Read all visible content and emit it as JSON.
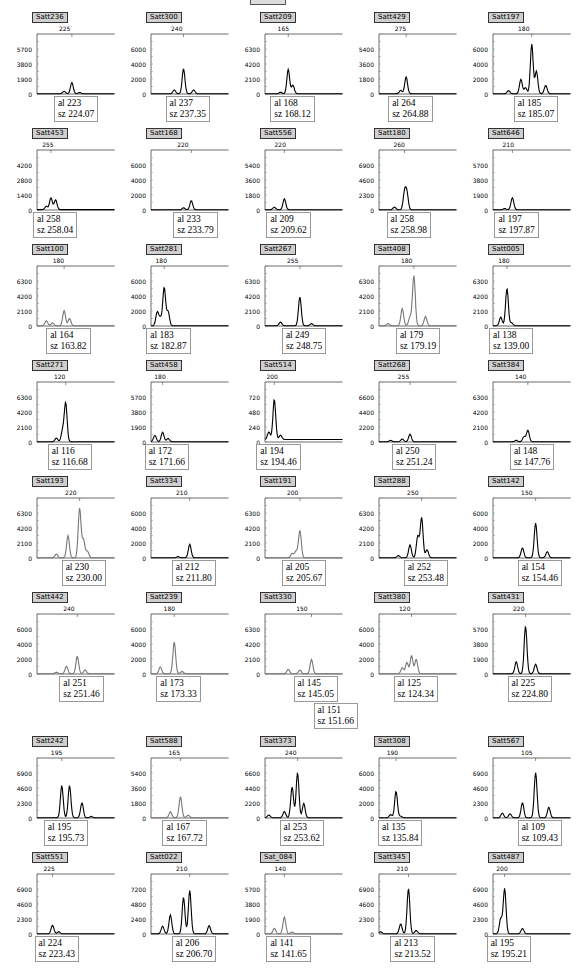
{
  "figure": {
    "top_marker": ""
  },
  "chart_data": [
    {
      "type": "line",
      "marker": "Satt236",
      "peak_label": "225",
      "yticks": [
        "5700",
        "3800",
        "1900",
        "0"
      ],
      "ymax": 7600,
      "trace_color": "#000",
      "peaks": [
        [
          0.45,
          1400
        ],
        [
          0.35,
          300
        ],
        [
          0.55,
          150
        ]
      ],
      "al": "al 223",
      "sz": "sz 224.07"
    },
    {
      "type": "line",
      "marker": "Satt300",
      "peak_label": "240",
      "yticks": [
        "6000",
        "4000",
        "2000",
        "0"
      ],
      "ymax": 8000,
      "trace_color": "#000",
      "peaks": [
        [
          0.42,
          3300
        ],
        [
          0.3,
          500
        ],
        [
          0.55,
          500
        ]
      ],
      "al": "al 237",
      "sz": "sz 237.35"
    },
    {
      "type": "line",
      "marker": "Satt209",
      "peak_label": "165",
      "yticks": [
        "6300",
        "4200",
        "2100",
        "0"
      ],
      "ymax": 8400,
      "trace_color": "#000",
      "peaks": [
        [
          0.3,
          3400
        ],
        [
          0.36,
          1200
        ],
        [
          0.2,
          200
        ]
      ],
      "al": "al 168",
      "sz": "sz 168.12"
    },
    {
      "type": "line",
      "marker": "Satt429",
      "peak_label": "275",
      "yticks": [
        "5400",
        "3600",
        "1800",
        "0"
      ],
      "ymax": 7200,
      "trace_color": "#000",
      "peaks": [
        [
          0.35,
          2000
        ],
        [
          0.28,
          400
        ]
      ],
      "al": "al 264",
      "sz": "sz 264.88"
    },
    {
      "type": "line",
      "marker": "Satt197",
      "peak_label": "180",
      "yticks": [
        "6000",
        "4000",
        "2000",
        "0"
      ],
      "ymax": 8000,
      "trace_color": "#000",
      "peaks": [
        [
          0.5,
          6600
        ],
        [
          0.56,
          3000
        ],
        [
          0.36,
          1900
        ],
        [
          0.68,
          1100
        ],
        [
          0.2,
          400
        ],
        [
          0.42,
          800
        ]
      ],
      "al": "al 185",
      "sz": "sz 185.07"
    },
    {
      "type": "line",
      "marker": "Satt453",
      "peak_label": "255",
      "yticks": [
        "4200",
        "2800",
        "1400",
        "0"
      ],
      "ymax": 5600,
      "trace_color": "#000",
      "peaks": [
        [
          0.18,
          1100
        ],
        [
          0.24,
          900
        ],
        [
          0.12,
          300
        ]
      ],
      "al": "al 258",
      "sz": "sz 258.04"
    },
    {
      "type": "line",
      "marker": "Satt168",
      "peak_label": "220",
      "yticks": [
        "6000",
        "4000",
        "2000",
        "0"
      ],
      "ymax": 8000,
      "trace_color": "#000",
      "peaks": [
        [
          0.52,
          1200
        ],
        [
          0.42,
          250
        ]
      ],
      "al": "al 233",
      "sz": "sz 233.79"
    },
    {
      "type": "line",
      "marker": "Satt556",
      "peak_label": "220",
      "yticks": [
        "5400",
        "3600",
        "1800",
        "0"
      ],
      "ymax": 7200,
      "trace_color": "#000",
      "peaks": [
        [
          0.25,
          1300
        ],
        [
          0.12,
          300
        ]
      ],
      "al": "al 209",
      "sz": "sz 209.62"
    },
    {
      "type": "line",
      "marker": "Satt180",
      "peak_label": "260",
      "yticks": [
        "6900",
        "4600",
        "2300",
        "0"
      ],
      "ymax": 9200,
      "trace_color": "#000",
      "peaks": [
        [
          0.33,
          2600
        ],
        [
          0.2,
          400
        ],
        [
          0.36,
          2400
        ]
      ],
      "al": "al 258",
      "sz": "sz 258.98"
    },
    {
      "type": "line",
      "marker": "Satt646",
      "peak_label": "210",
      "yticks": [
        "5700",
        "3800",
        "1900",
        "0"
      ],
      "ymax": 7600,
      "trace_color": "#000",
      "peaks": [
        [
          0.25,
          1500
        ],
        [
          0.15,
          150
        ]
      ],
      "al": "al 197",
      "sz": "sz 197.87"
    },
    {
      "type": "line",
      "marker": "Satt100",
      "peak_label": "180",
      "yticks": [
        "6300",
        "4200",
        "2100",
        "0"
      ],
      "ymax": 8400,
      "trace_color": "#777",
      "peaks": [
        [
          0.35,
          2100
        ],
        [
          0.42,
          1000
        ],
        [
          0.12,
          700
        ],
        [
          0.2,
          400
        ]
      ],
      "al": "al 164",
      "sz": "sz 163.82"
    },
    {
      "type": "line",
      "marker": "Satt281",
      "peak_label": "180",
      "yticks": [
        "6000",
        "4000",
        "2000",
        "0"
      ],
      "ymax": 8000,
      "trace_color": "#000",
      "peaks": [
        [
          0.17,
          5100
        ],
        [
          0.08,
          1800
        ],
        [
          0.22,
          1900
        ],
        [
          0.12,
          1000
        ]
      ],
      "al": "al 183",
      "sz": "sz 182.87"
    },
    {
      "type": "line",
      "marker": "Satt267",
      "peak_label": "255",
      "yticks": [
        "6300",
        "4200",
        "2100",
        "0"
      ],
      "ymax": 8400,
      "trace_color": "#000",
      "peaks": [
        [
          0.45,
          4000
        ],
        [
          0.2,
          500
        ],
        [
          0.6,
          300
        ]
      ],
      "al": "al 249",
      "sz": "sz 248.75"
    },
    {
      "type": "line",
      "marker": "Satt408",
      "peak_label": "180",
      "yticks": [
        "6300",
        "4200",
        "2100",
        "0"
      ],
      "ymax": 8400,
      "trace_color": "#777",
      "peaks": [
        [
          0.45,
          7000
        ],
        [
          0.3,
          2400
        ],
        [
          0.6,
          1300
        ],
        [
          0.12,
          300
        ],
        [
          0.4,
          1200
        ]
      ],
      "al": "al 179",
      "sz": "sz 179.19"
    },
    {
      "type": "line",
      "marker": "Satt005",
      "peak_label": "180",
      "yticks": [
        "6300",
        "4200",
        "2100",
        "0"
      ],
      "ymax": 8400,
      "trace_color": "#000",
      "peaks": [
        [
          0.18,
          5200
        ],
        [
          0.1,
          1200
        ],
        [
          0.24,
          400
        ]
      ],
      "al": "al 138",
      "sz": "sz 139.00"
    },
    {
      "type": "line",
      "marker": "Satt271",
      "peak_label": "120",
      "yticks": [
        "6300",
        "4200",
        "2100",
        "0"
      ],
      "ymax": 8400,
      "trace_color": "#000",
      "peaks": [
        [
          0.37,
          5400
        ],
        [
          0.33,
          1500
        ],
        [
          0.25,
          500
        ]
      ],
      "al": "al 116",
      "sz": "sz 116.68"
    },
    {
      "type": "line",
      "marker": "Satt458",
      "peak_label": "180",
      "yticks": [
        "5700",
        "3800",
        "1900",
        "0"
      ],
      "ymax": 7600,
      "trace_color": "#000",
      "peaks": [
        [
          0.15,
          1200
        ],
        [
          0.05,
          800
        ],
        [
          0.22,
          400
        ]
      ],
      "al": "al 172",
      "sz": "sz 171.66"
    },
    {
      "type": "line",
      "marker": "Satt514",
      "peak_label": "200",
      "yticks": [
        "720",
        "480",
        "240",
        "0"
      ],
      "ymax": 960,
      "trace_color": "#000",
      "peaks": [
        [
          0.12,
          640
        ],
        [
          0.05,
          120
        ],
        [
          0.2,
          70
        ]
      ],
      "al": "al 194",
      "sz": "sz 194.46"
    },
    {
      "type": "line",
      "marker": "Satt268",
      "peak_label": "255",
      "yticks": [
        "6600",
        "4400",
        "2200",
        "0"
      ],
      "ymax": 8800,
      "trace_color": "#000",
      "peaks": [
        [
          0.4,
          1100
        ],
        [
          0.3,
          400
        ],
        [
          0.15,
          200
        ]
      ],
      "al": "al 250",
      "sz": "sz 251.24"
    },
    {
      "type": "line",
      "marker": "Satt384",
      "peak_label": "140",
      "yticks": [
        "6300",
        "4200",
        "2100",
        "0"
      ],
      "ymax": 8400,
      "trace_color": "#000",
      "peaks": [
        [
          0.45,
          1600
        ],
        [
          0.4,
          700
        ],
        [
          0.3,
          200
        ]
      ],
      "al": "al 148",
      "sz": "sz 147.76"
    },
    {
      "type": "line",
      "marker": "Satt193",
      "peak_label": "220",
      "yticks": [
        "6300",
        "4200",
        "2100",
        "0"
      ],
      "ymax": 8400,
      "trace_color": "#777",
      "peaks": [
        [
          0.55,
          6900
        ],
        [
          0.4,
          3100
        ],
        [
          0.65,
          900
        ],
        [
          0.25,
          500
        ],
        [
          0.6,
          2500
        ]
      ],
      "al": "al 230",
      "sz": "sz 230.00"
    },
    {
      "type": "line",
      "marker": "Satt334",
      "peak_label": "210",
      "yticks": [
        "6000",
        "4000",
        "2000",
        "0"
      ],
      "ymax": 8000,
      "trace_color": "#000",
      "peaks": [
        [
          0.5,
          1800
        ],
        [
          0.35,
          150
        ]
      ],
      "al": "al 212",
      "sz": "sz 211.80"
    },
    {
      "type": "line",
      "marker": "Satt191",
      "peak_label": "200",
      "yticks": [
        "6300",
        "4200",
        "2100",
        "0"
      ],
      "ymax": 8400,
      "trace_color": "#777",
      "peaks": [
        [
          0.45,
          3800
        ],
        [
          0.35,
          600
        ],
        [
          0.4,
          900
        ]
      ],
      "al": "al 205",
      "sz": "sz 205.67"
    },
    {
      "type": "line",
      "marker": "Satt288",
      "peak_label": "250",
      "yticks": [
        "6300",
        "4200",
        "2100",
        "0"
      ],
      "ymax": 8400,
      "trace_color": "#000",
      "peaks": [
        [
          0.55,
          5600
        ],
        [
          0.5,
          3000
        ],
        [
          0.4,
          1800
        ],
        [
          0.62,
          1100
        ],
        [
          0.25,
          300
        ]
      ],
      "al": "al 252",
      "sz": "sz 253.48"
    },
    {
      "type": "line",
      "marker": "Satt142",
      "peak_label": "150",
      "yticks": [
        "6000",
        "4000",
        "2000",
        "0"
      ],
      "ymax": 8000,
      "trace_color": "#000",
      "peaks": [
        [
          0.55,
          4600
        ],
        [
          0.38,
          1300
        ],
        [
          0.7,
          800
        ]
      ],
      "al": "al 154",
      "sz": "sz 154.46"
    },
    {
      "type": "line",
      "marker": "Satt442",
      "peak_label": "240",
      "yticks": [
        "6000",
        "4000",
        "2000",
        "0"
      ],
      "ymax": 8000,
      "trace_color": "#777",
      "peaks": [
        [
          0.52,
          2300
        ],
        [
          0.38,
          1000
        ],
        [
          0.62,
          500
        ],
        [
          0.25,
          200
        ]
      ],
      "al": "al 251",
      "sz": "sz 251.46"
    },
    {
      "type": "line",
      "marker": "Satt239",
      "peak_label": "180",
      "yticks": [
        "6000",
        "4000",
        "2000",
        "0"
      ],
      "ymax": 8000,
      "trace_color": "#777",
      "peaks": [
        [
          0.3,
          4200
        ],
        [
          0.12,
          900
        ],
        [
          0.4,
          300
        ]
      ],
      "al": "al 173",
      "sz": "sz 173.33"
    },
    {
      "type": "line",
      "marker": "Satt330",
      "peak_label": "150",
      "yticks": [
        "6300",
        "4200",
        "2100",
        "0"
      ],
      "ymax": 8400,
      "trace_color": "#777",
      "peaks": [
        [
          0.6,
          2000
        ],
        [
          0.3,
          600
        ],
        [
          0.45,
          500
        ]
      ],
      "al": "al 145",
      "sz": "sz 145.05",
      "al2": "al 151",
      "sz2": "sz 151.66"
    },
    {
      "type": "line",
      "marker": "Satt380",
      "peak_label": "120",
      "yticks": [
        "6000",
        "4000",
        "2000",
        "0"
      ],
      "ymax": 8000,
      "trace_color": "#777",
      "peaks": [
        [
          0.42,
          2400
        ],
        [
          0.48,
          1900
        ],
        [
          0.36,
          1500
        ],
        [
          0.3,
          800
        ]
      ],
      "al": "al 125",
      "sz": "sz 124.34"
    },
    {
      "type": "line",
      "marker": "Satt431",
      "peak_label": "220",
      "yticks": [
        "5700",
        "3800",
        "1900",
        "0"
      ],
      "ymax": 7600,
      "trace_color": "#000",
      "peaks": [
        [
          0.42,
          6000
        ],
        [
          0.3,
          1500
        ],
        [
          0.55,
          1200
        ]
      ],
      "al": "al 225",
      "sz": "sz 224.80"
    },
    {
      "type": "line",
      "marker": "Satt242",
      "peak_label": "195",
      "yticks": [
        "6900",
        "4600",
        "2300",
        "0"
      ],
      "ymax": 9200,
      "trace_color": "#000",
      "peaks": [
        [
          0.32,
          4900
        ],
        [
          0.42,
          4900
        ],
        [
          0.58,
          2300
        ],
        [
          0.7,
          200
        ]
      ],
      "al": "al 195",
      "sz": "sz 195.73"
    },
    {
      "type": "line",
      "marker": "Satt588",
      "peak_label": "165",
      "yticks": [
        "5400",
        "3600",
        "1800",
        "0"
      ],
      "ymax": 7200,
      "trace_color": "#777",
      "peaks": [
        [
          0.38,
          2500
        ],
        [
          0.25,
          700
        ],
        [
          0.48,
          300
        ]
      ],
      "al": "al 167",
      "sz": "sz 167.72"
    },
    {
      "type": "line",
      "marker": "Satt373",
      "peak_label": "240",
      "yticks": [
        "6600",
        "4400",
        "2200",
        "0"
      ],
      "ymax": 8800,
      "trace_color": "#000",
      "peaks": [
        [
          0.42,
          6600
        ],
        [
          0.35,
          4500
        ],
        [
          0.5,
          2100
        ],
        [
          0.25,
          900
        ],
        [
          0.05,
          400
        ]
      ],
      "al": "al 253",
      "sz": "sz 253.62"
    },
    {
      "type": "line",
      "marker": "Satt308",
      "peak_label": "190",
      "yticks": [
        "6000",
        "4000",
        "2000",
        "0"
      ],
      "ymax": 8000,
      "trace_color": "#000",
      "peaks": [
        [
          0.22,
          3500
        ],
        [
          0.15,
          400
        ],
        [
          0.28,
          200
        ]
      ],
      "al": "al 135",
      "sz": "sz 135.84"
    },
    {
      "type": "line",
      "marker": "Satt567",
      "peak_label": "105",
      "yticks": [
        "6900",
        "4600",
        "2300",
        "0"
      ],
      "ymax": 9200,
      "trace_color": "#000",
      "peaks": [
        [
          0.55,
          6900
        ],
        [
          0.38,
          2300
        ],
        [
          0.72,
          1600
        ],
        [
          0.12,
          700
        ],
        [
          0.22,
          600
        ]
      ],
      "al": "al 109",
      "sz": "sz 109.43"
    },
    {
      "type": "line",
      "marker": "Satt551",
      "peak_label": "225",
      "yticks": [
        "6900",
        "4600",
        "2300",
        "0"
      ],
      "ymax": 9200,
      "trace_color": "#000",
      "peaks": [
        [
          0.2,
          1300
        ],
        [
          0.28,
          300
        ]
      ],
      "al": "al 224",
      "sz": "sz 223.43"
    },
    {
      "type": "line",
      "marker": "Satt022",
      "peak_label": "210",
      "yticks": [
        "7200",
        "4800",
        "2400",
        "0"
      ],
      "ymax": 9600,
      "trace_color": "#000",
      "peaks": [
        [
          0.5,
          6900
        ],
        [
          0.42,
          5800
        ],
        [
          0.25,
          3000
        ],
        [
          0.15,
          1200
        ],
        [
          0.75,
          1300
        ]
      ],
      "al": "al 206",
      "sz": "sz 206.70"
    },
    {
      "type": "line",
      "marker": "Sat_084",
      "peak_label": "140",
      "yticks": [
        "5700",
        "3800",
        "1900",
        "0"
      ],
      "ymax": 7600,
      "trace_color": "#777",
      "peaks": [
        [
          0.25,
          2100
        ],
        [
          0.12,
          700
        ],
        [
          0.35,
          200
        ]
      ],
      "al": "al 141",
      "sz": "sz 141.65"
    },
    {
      "type": "line",
      "marker": "Satt345",
      "peak_label": "210",
      "yticks": [
        "6900",
        "4600",
        "2300",
        "0"
      ],
      "ymax": 9200,
      "trace_color": "#000",
      "peaks": [
        [
          0.38,
          6900
        ],
        [
          0.28,
          1500
        ],
        [
          0.48,
          500
        ],
        [
          0.02,
          300
        ]
      ],
      "al": "al 213",
      "sz": "sz 213.52"
    },
    {
      "type": "line",
      "marker": "Satt487",
      "peak_label": "200",
      "yticks": [
        "6900",
        "4600",
        "2300",
        "0"
      ],
      "ymax": 9200,
      "trace_color": "#000",
      "peaks": [
        [
          0.15,
          6900
        ],
        [
          0.1,
          2300
        ],
        [
          0.38,
          800
        ]
      ],
      "al": "al 195",
      "sz": "sz 195.21"
    }
  ]
}
